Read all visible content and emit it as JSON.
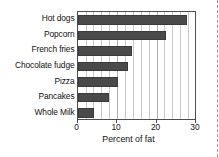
{
  "chart_data": {
    "type": "bar",
    "orientation": "horizontal",
    "title": "",
    "xlabel": "Percent of fat",
    "ylabel": "",
    "categories": [
      "Hot dogs",
      "Popcorn",
      "French fries",
      "Chocolate fudge",
      "Pizza",
      "Pancakes",
      "Whole Milk"
    ],
    "values": [
      27.7,
      22.5,
      13.8,
      12.7,
      10.2,
      7.9,
      4.1
    ],
    "xlim": [
      0,
      30.3
    ],
    "xticks": [
      0,
      10,
      20,
      30
    ],
    "xticklabels": [
      "0",
      "10",
      "20",
      "30"
    ],
    "minor_gridlines_step": 2,
    "grid": true,
    "legend": false,
    "bar_color": "#4a4a4a",
    "gridline_color": "#c9c9c9",
    "axis_color": "#4c4c4c",
    "background": "#ffffff"
  }
}
